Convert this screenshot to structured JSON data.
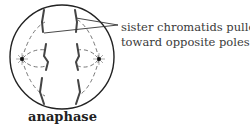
{
  "diagram": {
    "stage_label": "anaphase",
    "callout": {
      "line1": "sister chromatids pulled",
      "line2": "toward opposite poles"
    },
    "colors": {
      "outline": "#222222",
      "spindle": "#555555",
      "chromatid": "#444444",
      "text": "#3a3a3a"
    }
  }
}
